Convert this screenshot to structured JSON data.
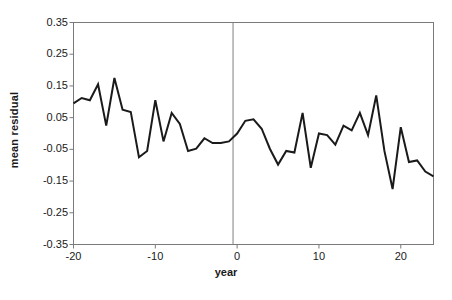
{
  "chart_data": {
    "type": "line",
    "title": "",
    "xlabel": "year",
    "ylabel": "mean residual",
    "xlim": [
      -20,
      24
    ],
    "ylim": [
      -0.35,
      0.35
    ],
    "grid": false,
    "legend": null,
    "xticks": [
      -20,
      -10,
      0,
      10,
      20
    ],
    "xtick_labels": [
      "-20",
      "-10",
      "0",
      "10",
      "20"
    ],
    "yticks": [
      0.35,
      0.25,
      0.15,
      0.05,
      -0.05,
      -0.15,
      -0.25,
      -0.35
    ],
    "ytick_labels": [
      "0.35",
      "0.25",
      "0.15",
      "0.05",
      "-0.05",
      "-0.15",
      "-0.25",
      "-0.35"
    ],
    "annotations": [
      {
        "type": "vline",
        "x": -0.5,
        "color": "#808080",
        "label": "zero-year-reference-line"
      }
    ],
    "series": [
      {
        "name": "mean residual",
        "color": "#1a1a1a",
        "line_width": 2,
        "x": [
          -20,
          -19,
          -18,
          -17,
          -16,
          -15,
          -14,
          -13,
          -12,
          -11,
          -10,
          -9,
          -8,
          -7,
          -6,
          -5,
          -4,
          -3,
          -2,
          -1,
          0,
          1,
          2,
          3,
          4,
          5,
          6,
          7,
          8,
          9,
          10,
          11,
          12,
          13,
          14,
          15,
          16,
          17,
          18,
          19,
          20,
          21,
          22,
          23,
          24
        ],
        "values": [
          0.095,
          0.112,
          0.105,
          0.155,
          0.025,
          0.175,
          0.075,
          0.068,
          -0.075,
          -0.055,
          0.105,
          -0.025,
          0.065,
          0.03,
          -0.055,
          -0.048,
          -0.015,
          -0.03,
          -0.03,
          -0.025,
          0.0,
          0.04,
          0.045,
          0.015,
          -0.048,
          -0.098,
          -0.055,
          -0.06,
          0.065,
          -0.108,
          0.0,
          -0.005,
          -0.035,
          0.025,
          0.01,
          0.065,
          -0.005,
          0.12,
          -0.055,
          -0.175,
          0.02,
          -0.09,
          -0.085,
          -0.12,
          -0.135
        ]
      }
    ]
  },
  "caption": {
    "ghost_text": ""
  }
}
